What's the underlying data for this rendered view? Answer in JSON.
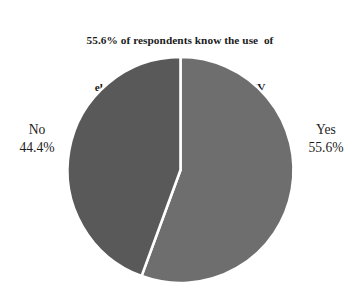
{
  "chart_data": {
    "type": "pie",
    "title": "55.6% of respondents know the use  of electricity generated from solar PV installed at home or in the company",
    "title_lines": [
      "55.6% of respondents know the use  of",
      "electricity generated from solar PV",
      "installed at home or in the company"
    ],
    "xlabel": "",
    "ylabel": "",
    "grid": false,
    "legend_position": "none",
    "labels_position": "outside-left-right",
    "start_angle_deg": 0,
    "direction": "clockwise",
    "total_percent": 100.0,
    "categories": [
      "Yes",
      "No"
    ],
    "values": [
      55.6,
      44.4
    ],
    "units": "percent",
    "slices": [
      {
        "name": "Yes",
        "value": 55.6,
        "value_label": "55.6%",
        "color": "#6e6e6e",
        "angle_deg": 200.2,
        "side": "right"
      },
      {
        "name": "No",
        "value": 44.4,
        "value_label": "44.4%",
        "color": "#595959",
        "angle_deg": 159.8,
        "side": "left"
      }
    ],
    "annotations": []
  },
  "style": {
    "background": "#ffffff",
    "divider_color": "#ffffff",
    "text_color": "#1b1b1b",
    "slice_yes_color": "#6e6e6e",
    "slice_no_color": "#595959"
  },
  "labels": {
    "no": {
      "name": "No",
      "percent": "44.4%"
    },
    "yes": {
      "name": "Yes",
      "percent": "55.6%"
    }
  }
}
